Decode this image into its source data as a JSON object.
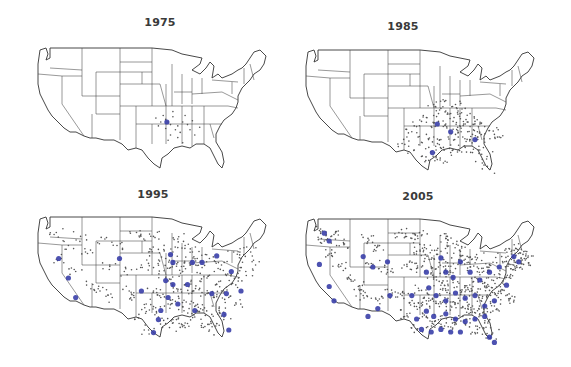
{
  "figure": {
    "colors": {
      "small_store": "#555555",
      "large_store": "#3a3fa8",
      "state_lines": "#444444",
      "background": "#ffffff"
    }
  },
  "panels": [
    {
      "year": "1975",
      "density": "very low",
      "concentration": "Arkansas / Missouri / Oklahoma border region",
      "small_dots": [
        [
          0.55,
          0.58
        ],
        [
          0.56,
          0.6
        ],
        [
          0.57,
          0.62
        ],
        [
          0.58,
          0.56
        ],
        [
          0.53,
          0.6
        ],
        [
          0.6,
          0.63
        ],
        [
          0.62,
          0.6
        ],
        [
          0.59,
          0.66
        ],
        [
          0.55,
          0.65
        ],
        [
          0.57,
          0.7
        ],
        [
          0.61,
          0.68
        ],
        [
          0.64,
          0.62
        ],
        [
          0.65,
          0.66
        ],
        [
          0.52,
          0.63
        ],
        [
          0.58,
          0.52
        ],
        [
          0.54,
          0.55
        ],
        [
          0.63,
          0.55
        ],
        [
          0.66,
          0.59
        ],
        [
          0.6,
          0.72
        ],
        [
          0.56,
          0.74
        ],
        [
          0.67,
          0.7
        ],
        [
          0.62,
          0.76
        ],
        [
          0.69,
          0.64
        ],
        [
          0.51,
          0.57
        ]
      ],
      "big_dots": [
        [
          0.555,
          0.6
        ]
      ]
    },
    {
      "year": "1985",
      "density": "moderate",
      "concentration": "South-central and southeastern states",
      "small_dots": [
        [
          0.55,
          0.45
        ],
        [
          0.58,
          0.48
        ],
        [
          0.6,
          0.5
        ],
        [
          0.62,
          0.52
        ],
        [
          0.52,
          0.55
        ],
        [
          0.5,
          0.58
        ],
        [
          0.48,
          0.62
        ],
        [
          0.54,
          0.62
        ],
        [
          0.57,
          0.58
        ],
        [
          0.6,
          0.6
        ],
        [
          0.63,
          0.58
        ],
        [
          0.66,
          0.56
        ],
        [
          0.68,
          0.6
        ],
        [
          0.7,
          0.62
        ],
        [
          0.72,
          0.58
        ],
        [
          0.74,
          0.6
        ],
        [
          0.76,
          0.62
        ],
        [
          0.78,
          0.65
        ],
        [
          0.8,
          0.68
        ],
        [
          0.52,
          0.68
        ],
        [
          0.55,
          0.7
        ],
        [
          0.58,
          0.72
        ],
        [
          0.61,
          0.7
        ],
        [
          0.64,
          0.68
        ],
        [
          0.67,
          0.7
        ],
        [
          0.7,
          0.72
        ],
        [
          0.73,
          0.7
        ],
        [
          0.76,
          0.74
        ],
        [
          0.5,
          0.74
        ],
        [
          0.53,
          0.78
        ],
        [
          0.56,
          0.8
        ],
        [
          0.59,
          0.78
        ],
        [
          0.62,
          0.82
        ],
        [
          0.65,
          0.8
        ],
        [
          0.68,
          0.78
        ],
        [
          0.71,
          0.82
        ],
        [
          0.74,
          0.8
        ],
        [
          0.77,
          0.85
        ],
        [
          0.47,
          0.8
        ],
        [
          0.5,
          0.85
        ],
        [
          0.53,
          0.88
        ],
        [
          0.56,
          0.86
        ],
        [
          0.59,
          0.9
        ],
        [
          0.75,
          0.9
        ],
        [
          0.78,
          0.95
        ],
        [
          0.44,
          0.7
        ],
        [
          0.42,
          0.75
        ],
        [
          0.46,
          0.66
        ],
        [
          0.65,
          0.5
        ],
        [
          0.7,
          0.52
        ],
        [
          0.68,
          0.48
        ],
        [
          0.6,
          0.42
        ],
        [
          0.64,
          0.45
        ],
        [
          0.57,
          0.52
        ],
        [
          0.73,
          0.66
        ],
        [
          0.82,
          0.7
        ],
        [
          0.63,
          0.64
        ],
        [
          0.66,
          0.62
        ],
        [
          0.69,
          0.66
        ],
        [
          0.71,
          0.68
        ]
      ],
      "big_dots": [
        [
          0.565,
          0.6
        ],
        [
          0.62,
          0.66
        ],
        [
          0.72,
          0.72
        ],
        [
          0.545,
          0.82
        ]
      ]
    },
    {
      "year": "1995",
      "density": "high",
      "concentration": "Nationwide, densest in the eastern half",
      "small_dots": [
        [
          0.1,
          0.15
        ],
        [
          0.15,
          0.25
        ],
        [
          0.2,
          0.18
        ],
        [
          0.22,
          0.3
        ],
        [
          0.12,
          0.35
        ],
        [
          0.18,
          0.45
        ],
        [
          0.25,
          0.55
        ],
        [
          0.3,
          0.2
        ],
        [
          0.35,
          0.25
        ],
        [
          0.32,
          0.4
        ],
        [
          0.38,
          0.45
        ],
        [
          0.28,
          0.6
        ],
        [
          0.33,
          0.65
        ],
        [
          0.4,
          0.6
        ],
        [
          0.43,
          0.15
        ],
        [
          0.46,
          0.2
        ],
        [
          0.5,
          0.18
        ],
        [
          0.48,
          0.3
        ],
        [
          0.52,
          0.28
        ],
        [
          0.45,
          0.4
        ],
        [
          0.5,
          0.42
        ],
        [
          0.55,
          0.35
        ],
        [
          0.58,
          0.3
        ],
        [
          0.6,
          0.38
        ],
        [
          0.62,
          0.45
        ],
        [
          0.65,
          0.4
        ],
        [
          0.68,
          0.35
        ],
        [
          0.7,
          0.42
        ],
        [
          0.72,
          0.5
        ],
        [
          0.75,
          0.45
        ],
        [
          0.78,
          0.4
        ],
        [
          0.8,
          0.48
        ],
        [
          0.82,
          0.55
        ],
        [
          0.85,
          0.5
        ],
        [
          0.88,
          0.45
        ],
        [
          0.55,
          0.5
        ],
        [
          0.58,
          0.55
        ],
        [
          0.6,
          0.6
        ],
        [
          0.63,
          0.55
        ],
        [
          0.66,
          0.6
        ],
        [
          0.69,
          0.58
        ],
        [
          0.72,
          0.62
        ],
        [
          0.75,
          0.65
        ],
        [
          0.78,
          0.6
        ],
        [
          0.81,
          0.65
        ],
        [
          0.5,
          0.6
        ],
        [
          0.53,
          0.65
        ],
        [
          0.56,
          0.7
        ],
        [
          0.59,
          0.68
        ],
        [
          0.62,
          0.72
        ],
        [
          0.65,
          0.7
        ],
        [
          0.68,
          0.75
        ],
        [
          0.71,
          0.73
        ],
        [
          0.74,
          0.78
        ],
        [
          0.77,
          0.75
        ],
        [
          0.5,
          0.72
        ],
        [
          0.52,
          0.8
        ],
        [
          0.55,
          0.85
        ],
        [
          0.58,
          0.82
        ],
        [
          0.61,
          0.88
        ],
        [
          0.64,
          0.85
        ],
        [
          0.67,
          0.8
        ],
        [
          0.7,
          0.85
        ],
        [
          0.73,
          0.9
        ],
        [
          0.76,
          0.85
        ],
        [
          0.47,
          0.7
        ],
        [
          0.44,
          0.78
        ],
        [
          0.48,
          0.9
        ],
        [
          0.42,
          0.65
        ],
        [
          0.9,
          0.3
        ],
        [
          0.86,
          0.35
        ],
        [
          0.83,
          0.3
        ],
        [
          0.92,
          0.4
        ],
        [
          0.6,
          0.2
        ],
        [
          0.63,
          0.25
        ],
        [
          0.66,
          0.3
        ],
        [
          0.57,
          0.42
        ],
        [
          0.73,
          0.35
        ],
        [
          0.76,
          0.55
        ],
        [
          0.84,
          0.7
        ],
        [
          0.79,
          0.8
        ]
      ],
      "big_dots": [
        [
          0.11,
          0.35
        ],
        [
          0.15,
          0.5
        ],
        [
          0.18,
          0.65
        ],
        [
          0.36,
          0.35
        ],
        [
          0.45,
          0.6
        ],
        [
          0.57,
          0.32
        ],
        [
          0.58,
          0.38
        ],
        [
          0.55,
          0.52
        ],
        [
          0.58,
          0.55
        ],
        [
          0.53,
          0.75
        ],
        [
          0.56,
          0.65
        ],
        [
          0.66,
          0.38
        ],
        [
          0.7,
          0.38
        ],
        [
          0.76,
          0.33
        ],
        [
          0.82,
          0.45
        ],
        [
          0.86,
          0.6
        ],
        [
          0.8,
          0.62
        ],
        [
          0.74,
          0.62
        ],
        [
          0.64,
          0.55
        ],
        [
          0.6,
          0.7
        ],
        [
          0.67,
          0.75
        ],
        [
          0.79,
          0.78
        ],
        [
          0.81,
          0.9
        ],
        [
          0.52,
          0.82
        ],
        [
          0.5,
          0.92
        ]
      ]
    },
    {
      "year": "2005",
      "density": "very high",
      "concentration": "Nationwide saturation, densest east of the Rockies",
      "small_dots": [
        [
          0.08,
          0.12
        ],
        [
          0.1,
          0.2
        ],
        [
          0.14,
          0.15
        ],
        [
          0.18,
          0.22
        ],
        [
          0.12,
          0.3
        ],
        [
          0.16,
          0.4
        ],
        [
          0.2,
          0.48
        ],
        [
          0.24,
          0.55
        ],
        [
          0.28,
          0.18
        ],
        [
          0.32,
          0.24
        ],
        [
          0.3,
          0.38
        ],
        [
          0.36,
          0.42
        ],
        [
          0.26,
          0.62
        ],
        [
          0.32,
          0.66
        ],
        [
          0.38,
          0.6
        ],
        [
          0.42,
          0.14
        ],
        [
          0.46,
          0.18
        ],
        [
          0.5,
          0.16
        ],
        [
          0.48,
          0.28
        ],
        [
          0.52,
          0.26
        ],
        [
          0.44,
          0.38
        ],
        [
          0.5,
          0.4
        ],
        [
          0.54,
          0.34
        ],
        [
          0.58,
          0.28
        ],
        [
          0.6,
          0.36
        ],
        [
          0.62,
          0.44
        ],
        [
          0.65,
          0.38
        ],
        [
          0.68,
          0.34
        ],
        [
          0.7,
          0.4
        ],
        [
          0.72,
          0.48
        ],
        [
          0.75,
          0.44
        ],
        [
          0.78,
          0.38
        ],
        [
          0.8,
          0.46
        ],
        [
          0.82,
          0.54
        ],
        [
          0.85,
          0.48
        ],
        [
          0.88,
          0.42
        ],
        [
          0.9,
          0.35
        ],
        [
          0.93,
          0.3
        ],
        [
          0.55,
          0.48
        ],
        [
          0.58,
          0.54
        ],
        [
          0.6,
          0.58
        ],
        [
          0.63,
          0.52
        ],
        [
          0.66,
          0.58
        ],
        [
          0.69,
          0.56
        ],
        [
          0.72,
          0.6
        ],
        [
          0.75,
          0.64
        ],
        [
          0.78,
          0.58
        ],
        [
          0.81,
          0.62
        ],
        [
          0.84,
          0.58
        ],
        [
          0.5,
          0.58
        ],
        [
          0.53,
          0.64
        ],
        [
          0.56,
          0.68
        ],
        [
          0.59,
          0.66
        ],
        [
          0.62,
          0.7
        ],
        [
          0.65,
          0.68
        ],
        [
          0.68,
          0.72
        ],
        [
          0.71,
          0.7
        ],
        [
          0.74,
          0.76
        ],
        [
          0.77,
          0.72
        ],
        [
          0.8,
          0.7
        ],
        [
          0.5,
          0.7
        ],
        [
          0.52,
          0.78
        ],
        [
          0.55,
          0.84
        ],
        [
          0.58,
          0.8
        ],
        [
          0.61,
          0.86
        ],
        [
          0.64,
          0.83
        ],
        [
          0.67,
          0.78
        ],
        [
          0.7,
          0.83
        ],
        [
          0.73,
          0.88
        ],
        [
          0.76,
          0.83
        ],
        [
          0.79,
          0.92
        ],
        [
          0.47,
          0.68
        ],
        [
          0.44,
          0.76
        ],
        [
          0.48,
          0.88
        ],
        [
          0.42,
          0.62
        ],
        [
          0.86,
          0.38
        ],
        [
          0.83,
          0.32
        ],
        [
          0.92,
          0.38
        ],
        [
          0.6,
          0.18
        ],
        [
          0.63,
          0.22
        ],
        [
          0.66,
          0.28
        ],
        [
          0.57,
          0.4
        ],
        [
          0.73,
          0.33
        ],
        [
          0.76,
          0.52
        ],
        [
          0.86,
          0.66
        ],
        [
          0.87,
          0.3
        ],
        [
          0.89,
          0.26
        ],
        [
          0.91,
          0.33
        ]
      ],
      "big_dots": [
        [
          0.1,
          0.14
        ],
        [
          0.12,
          0.2
        ],
        [
          0.08,
          0.38
        ],
        [
          0.12,
          0.55
        ],
        [
          0.14,
          0.66
        ],
        [
          0.26,
          0.32
        ],
        [
          0.3,
          0.4
        ],
        [
          0.36,
          0.36
        ],
        [
          0.37,
          0.62
        ],
        [
          0.28,
          0.78
        ],
        [
          0.32,
          0.72
        ],
        [
          0.46,
          0.62
        ],
        [
          0.52,
          0.44
        ],
        [
          0.53,
          0.56
        ],
        [
          0.58,
          0.33
        ],
        [
          0.6,
          0.44
        ],
        [
          0.63,
          0.48
        ],
        [
          0.66,
          0.36
        ],
        [
          0.7,
          0.44
        ],
        [
          0.74,
          0.5
        ],
        [
          0.78,
          0.44
        ],
        [
          0.82,
          0.4
        ],
        [
          0.85,
          0.54
        ],
        [
          0.88,
          0.32
        ],
        [
          0.9,
          0.36
        ],
        [
          0.56,
          0.62
        ],
        [
          0.6,
          0.66
        ],
        [
          0.64,
          0.6
        ],
        [
          0.68,
          0.64
        ],
        [
          0.72,
          0.62
        ],
        [
          0.76,
          0.7
        ],
        [
          0.8,
          0.66
        ],
        [
          0.52,
          0.74
        ],
        [
          0.55,
          0.78
        ],
        [
          0.6,
          0.76
        ],
        [
          0.64,
          0.8
        ],
        [
          0.68,
          0.82
        ],
        [
          0.72,
          0.8
        ],
        [
          0.76,
          0.78
        ],
        [
          0.5,
          0.88
        ],
        [
          0.54,
          0.9
        ],
        [
          0.58,
          0.88
        ],
        [
          0.62,
          0.9
        ],
        [
          0.66,
          0.9
        ],
        [
          0.78,
          0.94
        ],
        [
          0.8,
          0.98
        ],
        [
          0.48,
          0.8
        ]
      ]
    }
  ]
}
